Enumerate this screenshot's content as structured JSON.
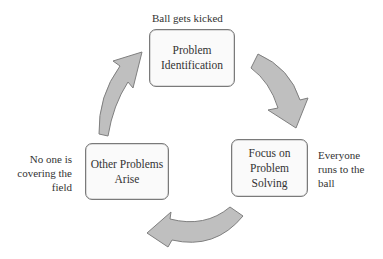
{
  "diagram": {
    "type": "cycle",
    "nodes": [
      {
        "id": "top",
        "label": "Problem\nIdentification",
        "annotation": "Ball gets kicked"
      },
      {
        "id": "right",
        "label": "Focus on\nProblem Solving",
        "annotation": "Everyone\nruns to the\nball"
      },
      {
        "id": "left",
        "label": "Other Problems\nArise",
        "annotation": "No one is\ncovering the\nfield"
      }
    ],
    "arrows": [
      {
        "from": "top",
        "to": "right",
        "direction": "clockwise"
      },
      {
        "from": "right",
        "to": "left",
        "direction": "clockwise"
      },
      {
        "from": "left",
        "to": "top",
        "direction": "clockwise"
      }
    ],
    "colors": {
      "arrow_fill": "#bfbfbf",
      "arrow_stroke": "#7f7f7f",
      "box_border": "#7a7a7a"
    }
  }
}
